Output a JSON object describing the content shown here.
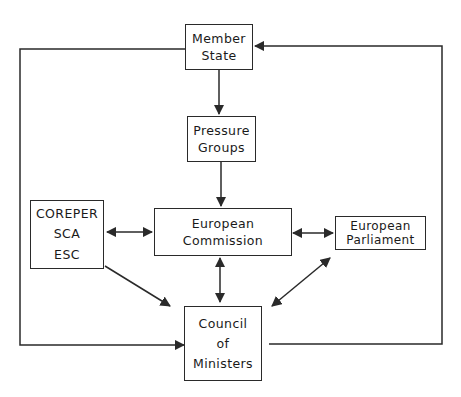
{
  "diagram": {
    "type": "flow",
    "nodes": {
      "member_state": {
        "lines": [
          "Member",
          "State"
        ]
      },
      "pressure_groups": {
        "lines": [
          "Pressure",
          "Groups"
        ]
      },
      "coreper": {
        "lines": [
          "COREPER",
          "SCA",
          "ESC"
        ]
      },
      "european_commission": {
        "lines": [
          "European",
          "Commission"
        ]
      },
      "european_parliament": {
        "lines": [
          "European",
          "Parliament"
        ]
      },
      "council_of_ministers": {
        "lines": [
          "Council",
          "of",
          "Ministers"
        ]
      }
    },
    "edges": [
      {
        "from": "Member State",
        "to": "Pressure Groups",
        "direction": "one-way"
      },
      {
        "from": "Pressure Groups",
        "to": "European Commission",
        "direction": "one-way"
      },
      {
        "from": "COREPER / SCA / ESC",
        "to": "European Commission",
        "direction": "two-way"
      },
      {
        "from": "European Commission",
        "to": "European Parliament",
        "direction": "two-way"
      },
      {
        "from": "European Commission",
        "to": "Council of Ministers",
        "direction": "two-way"
      },
      {
        "from": "COREPER / SCA / ESC",
        "to": "Council of Ministers",
        "direction": "one-way"
      },
      {
        "from": "Council of Ministers",
        "to": "European Parliament",
        "direction": "two-way"
      },
      {
        "from": "Member State",
        "to": "Council of Ministers",
        "direction": "one-way",
        "route": "left loop"
      },
      {
        "from": "Council of Ministers",
        "to": "Member State",
        "direction": "one-way",
        "route": "right loop"
      }
    ],
    "colors": {
      "line": "#2a2a2a",
      "background": "#ffffff"
    }
  }
}
